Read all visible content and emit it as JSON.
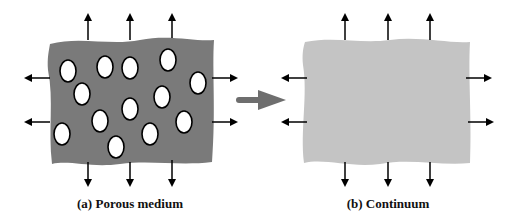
{
  "panels": [
    {
      "id": "a",
      "caption": "(a) Porous medium",
      "fill": "#7a7a7a",
      "pores": [
        [
          68,
          71
        ],
        [
          105,
          67
        ],
        [
          130,
          68
        ],
        [
          168,
          60
        ],
        [
          198,
          83
        ],
        [
          82,
          94
        ],
        [
          162,
          97
        ],
        [
          130,
          109
        ],
        [
          100,
          121
        ],
        [
          184,
          122
        ],
        [
          62,
          134
        ],
        [
          150,
          134
        ],
        [
          116,
          147
        ]
      ]
    },
    {
      "id": "b",
      "caption": "(b) Continuum",
      "fill": "#c4c4c4"
    }
  ],
  "transition_arrow_color": "#6e6e6e",
  "arrow_color": "#000000"
}
